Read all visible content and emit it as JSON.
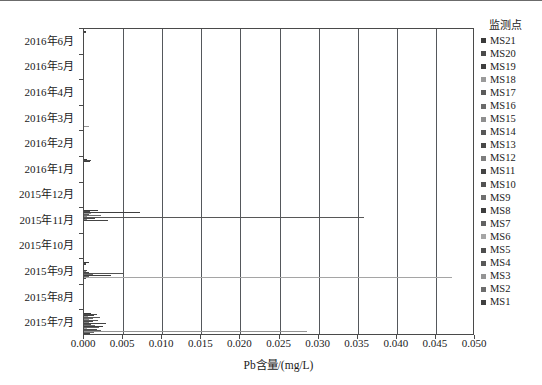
{
  "chart_data": {
    "type": "bar",
    "orientation": "horizontal",
    "title": "",
    "xlabel": "Pb含量/(mg/L)",
    "ylabel": "",
    "xlim": [
      0.0,
      0.05
    ],
    "xticks": [
      "0.000",
      "0.005",
      "0.010",
      "0.015",
      "0.020",
      "0.025",
      "0.030",
      "0.035",
      "0.040",
      "0.045",
      "0.050"
    ],
    "xtick_values": [
      0.0,
      0.005,
      0.01,
      0.015,
      0.02,
      0.025,
      0.03,
      0.035,
      0.04,
      0.045,
      0.05
    ],
    "grid": "vertical",
    "legend_position": "right",
    "legend_title": "监测点",
    "categories": [
      "2016年6月",
      "2016年5月",
      "2016年4月",
      "2016年3月",
      "2016年2月",
      "2016年1月",
      "2015年12月",
      "2015年11月",
      "2015年10月",
      "2015年9月",
      "2015年8月",
      "2015年7月"
    ],
    "series": [
      {
        "name": "MS21",
        "color": "#3a3a3a",
        "values": [
          0.0003,
          0.0,
          0.0,
          0.0,
          0.0,
          0.0004,
          0.0,
          0.0018,
          0.0,
          0.0006,
          0.0,
          0.0009
        ]
      },
      {
        "name": "MS20",
        "color": "#4a4a4a",
        "values": [
          0.0002,
          0.0,
          0.0,
          0.0,
          0.0,
          0.0009,
          0.0,
          0.0008,
          0.0,
          0.0003,
          0.0,
          0.0016
        ]
      },
      {
        "name": "MS19",
        "color": "#3f3f3f",
        "values": [
          0.0,
          0.0,
          0.0,
          0.0,
          0.0,
          0.0008,
          0.0,
          0.0072,
          0.0,
          0.0002,
          0.0,
          0.0013
        ]
      },
      {
        "name": "MS18",
        "color": "#9a9a9a",
        "values": [
          0.0,
          0.0,
          0.0,
          0.0,
          0.0,
          0.0,
          0.0,
          0.0009,
          0.0,
          0.0,
          0.0,
          0.0005
        ]
      },
      {
        "name": "MS17",
        "color": "#5a5a5a",
        "values": [
          0.0,
          0.0,
          0.0,
          0.0,
          0.0,
          0.0,
          0.0,
          0.0006,
          0.0,
          0.0,
          0.0,
          0.0021
        ]
      },
      {
        "name": "MS16",
        "color": "#6a6a6a",
        "values": [
          0.0,
          0.0,
          0.0,
          0.0,
          0.0,
          0.0,
          0.0,
          0.0022,
          0.0,
          0.0,
          0.0,
          0.0011
        ]
      },
      {
        "name": "MS15",
        "color": "#8e8e8e",
        "values": [
          0.0,
          0.0,
          0.0,
          0.0,
          0.0,
          0.0,
          0.0,
          0.0004,
          0.0,
          0.0,
          0.0,
          0.0007
        ]
      },
      {
        "name": "MS14",
        "color": "#575757",
        "values": [
          0.0,
          0.0,
          0.0,
          0.0,
          0.0,
          0.0,
          0.0,
          0.0358,
          0.0,
          0.0,
          0.0,
          0.0018
        ]
      },
      {
        "name": "MS13",
        "color": "#484848",
        "values": [
          0.0,
          0.0,
          0.0,
          0.0,
          0.0,
          0.0,
          0.0,
          0.0014,
          0.0,
          0.0004,
          0.0,
          0.0012
        ]
      },
      {
        "name": "MS12",
        "color": "#7d7d7d",
        "values": [
          0.0,
          0.0,
          0.0,
          0.0,
          0.0,
          0.0,
          0.0,
          0.0004,
          0.0,
          0.0002,
          0.0,
          0.0006
        ]
      },
      {
        "name": "MS11",
        "color": "#444444",
        "values": [
          0.0,
          0.0,
          0.0,
          0.0,
          0.0,
          0.0,
          0.0,
          0.0031,
          0.0,
          0.0007,
          0.0,
          0.0028
        ]
      },
      {
        "name": "MS10",
        "color": "#525252",
        "values": [
          0.0,
          0.0,
          0.0,
          0.0,
          0.0,
          0.0,
          0.0,
          0.0,
          0.0,
          0.0051,
          0.0,
          0.0009
        ]
      },
      {
        "name": "MS9",
        "color": "#6f6f6f",
        "values": [
          0.0,
          0.0,
          0.0,
          0.0,
          0.0,
          0.0,
          0.0,
          0.0,
          0.0,
          0.0011,
          0.0,
          0.0014
        ]
      },
      {
        "name": "MS8",
        "color": "#3d3d3d",
        "values": [
          0.0,
          0.0,
          0.0,
          0.0,
          0.0,
          0.0,
          0.0,
          0.0,
          0.0,
          0.0035,
          0.0,
          0.0024
        ]
      },
      {
        "name": "MS7",
        "color": "#616161",
        "values": [
          0.0,
          0.0,
          0.0,
          0.0,
          0.0,
          0.0,
          0.0,
          0.0,
          0.0,
          0.0006,
          0.0,
          0.0019
        ]
      },
      {
        "name": "MS6",
        "color": "#a5a5a5",
        "values": [
          0.0,
          0.0,
          0.0,
          0.0,
          0.0,
          0.0,
          0.0,
          0.0,
          0.0,
          0.047,
          0.0,
          0.0004
        ]
      },
      {
        "name": "MS5",
        "color": "#4e4e4e",
        "values": [
          0.0,
          0.0,
          0.0,
          0.0,
          0.0,
          0.0,
          0.0,
          0.0,
          0.0,
          0.0003,
          0.0,
          0.0016
        ]
      },
      {
        "name": "MS4",
        "color": "#585858",
        "values": [
          0.0,
          0.0,
          0.0,
          0.0,
          0.0,
          0.0,
          0.0,
          0.0,
          0.0,
          0.0,
          0.0,
          0.0022
        ]
      },
      {
        "name": "MS3",
        "color": "#949494",
        "values": [
          0.0,
          0.0,
          0.0,
          0.0006,
          0.0,
          0.0,
          0.0,
          0.0,
          0.0,
          0.0,
          0.0,
          0.0285
        ]
      },
      {
        "name": "MS2",
        "color": "#6c6c6c",
        "values": [
          0.0,
          0.0,
          0.0,
          0.0,
          0.0,
          0.0,
          0.0,
          0.0,
          0.0,
          0.0,
          0.0,
          0.0013
        ]
      },
      {
        "name": "MS1",
        "color": "#404040",
        "values": [
          0.0,
          0.0,
          0.0,
          0.0,
          0.0,
          0.0,
          0.0,
          0.0,
          0.0,
          0.0,
          0.0,
          0.0008
        ]
      }
    ]
  }
}
